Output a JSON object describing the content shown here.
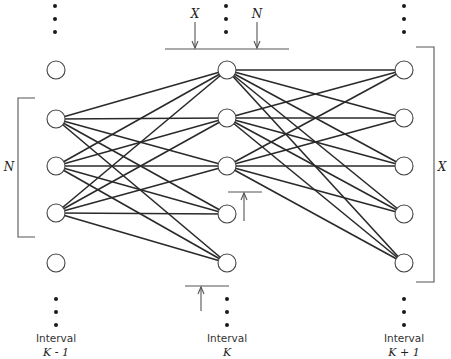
{
  "diagram": {
    "type": "layered-graph",
    "columns": [
      {
        "id": "interval-k-minus-1",
        "label_line1": "Interval",
        "label_line2": "K - 1",
        "x": 27,
        "nodes_y": [
          70,
          119,
          166,
          213,
          263
        ]
      },
      {
        "id": "interval-k",
        "label_line1": "Interval",
        "label_line2": "K",
        "x": 226,
        "nodes_y": [
          70,
          118,
          166,
          214,
          263
        ]
      },
      {
        "id": "interval-k-plus-1",
        "label_line1": "Interval",
        "label_line2": "K + 1",
        "x": 404,
        "nodes_y": [
          70,
          118,
          166,
          214,
          263
        ]
      }
    ],
    "edges_left_to_middle": {
      "from_nodes": [
        1,
        2,
        3
      ],
      "to_nodes": [
        0,
        1,
        2,
        3,
        4
      ]
    },
    "edges_middle_to_right": {
      "from_nodes": [
        0,
        1,
        2
      ],
      "to_nodes": [
        0,
        1,
        2,
        3,
        4
      ]
    },
    "annotations": {
      "left_bracket_label": "N",
      "right_bracket_label": "X",
      "top_arrow_left_label": "X",
      "top_arrow_right_label": "N"
    }
  }
}
